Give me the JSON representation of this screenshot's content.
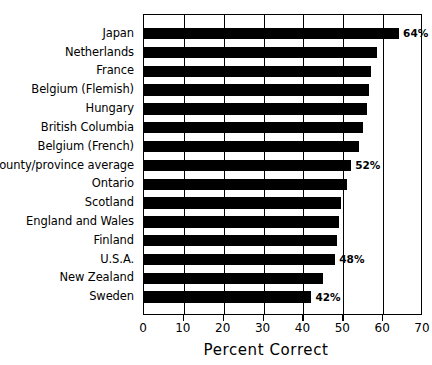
{
  "chart_data": {
    "type": "bar",
    "orientation": "horizontal",
    "title": "",
    "xlabel": "Percent Correct",
    "ylabel": "",
    "xlim": [
      0,
      70
    ],
    "xticks": [
      0,
      10,
      20,
      30,
      40,
      50,
      60,
      70
    ],
    "xtick_labels": [
      "0",
      "10",
      "20",
      "30",
      "40",
      "50",
      "60",
      "70"
    ],
    "grid": true,
    "grid_axis": "x",
    "legend": false,
    "bar_color": "#000000",
    "categories": [
      "Japan",
      "Netherlands",
      "France",
      "Belgium (Flemish)",
      "Hungary",
      "British Columbia",
      "Belgium (French)",
      "14 county/province average",
      "Ontario",
      "Scotland",
      "England and Wales",
      "Finland",
      "U.S.A.",
      "New Zealand",
      "Sweden"
    ],
    "values": [
      64,
      58.5,
      57,
      56.5,
      56,
      55,
      54,
      52,
      51,
      49.5,
      49,
      48.5,
      48,
      45,
      42
    ],
    "data_labels": [
      {
        "index": 0,
        "category": "Japan",
        "text": "64%"
      },
      {
        "index": 7,
        "category": "14 county/province average",
        "text": "52%"
      },
      {
        "index": 12,
        "category": "U.S.A.",
        "text": "48%"
      },
      {
        "index": 14,
        "category": "Sweden",
        "text": "42%"
      }
    ]
  }
}
